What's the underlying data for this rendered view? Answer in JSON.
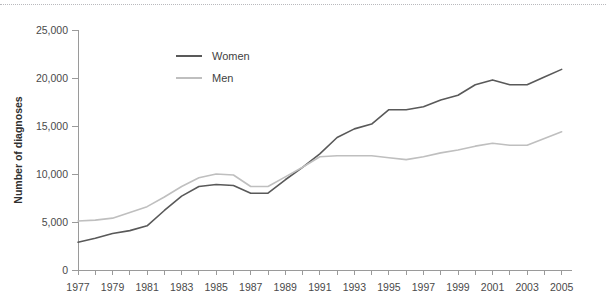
{
  "chart_data": {
    "type": "line",
    "title": "",
    "xlabel": "",
    "ylabel": "Number of diagnoses",
    "xlim": [
      1977,
      2005.6
    ],
    "ylim": [
      0,
      25000
    ],
    "grid": false,
    "legend_position": "inside-upper-left",
    "x": [
      1977,
      1978,
      1979,
      1980,
      1981,
      1982,
      1983,
      1984,
      1985,
      1986,
      1987,
      1988,
      1989,
      1990,
      1991,
      1992,
      1993,
      1994,
      1995,
      1996,
      1997,
      1998,
      1999,
      2000,
      2001,
      2002,
      2003,
      2004,
      2005
    ],
    "series": [
      {
        "name": "Women",
        "color": "#595959",
        "values": [
          2900,
          3300,
          3800,
          4100,
          4600,
          6200,
          7700,
          8700,
          8900,
          8800,
          8000,
          8000,
          9400,
          10700,
          12100,
          13800,
          14700,
          15200,
          16700,
          16700,
          17000,
          17700,
          18200,
          19300,
          19800,
          19300,
          19300,
          20100,
          20900
        ]
      },
      {
        "name": "Men",
        "color": "#bfbfbf",
        "values": [
          5100,
          5200,
          5400,
          6000,
          6600,
          7600,
          8700,
          9600,
          10000,
          9900,
          8700,
          8700,
          9700,
          10700,
          11800,
          11900,
          11900,
          11900,
          11700,
          11500,
          11800,
          12200,
          12500,
          12900,
          13200,
          13000,
          13000,
          13700,
          14400
        ]
      }
    ],
    "ytick_labels": [
      "0",
      "5,000",
      "10,000",
      "15,000",
      "20,000",
      "25,000"
    ],
    "ytick_values": [
      0,
      5000,
      10000,
      15000,
      20000,
      25000
    ],
    "xtick_labels": [
      "1977",
      "1979",
      "1981",
      "1983",
      "1985",
      "1987",
      "1989",
      "1991",
      "1993",
      "1995",
      "1997",
      "1999",
      "2001",
      "2003",
      "2005"
    ],
    "xtick_values": [
      1977,
      1979,
      1981,
      1983,
      1985,
      1987,
      1989,
      1991,
      1993,
      1995,
      1997,
      1999,
      2001,
      2003,
      2005
    ],
    "xminor_values": [
      1977,
      1978,
      1979,
      1980,
      1981,
      1982,
      1983,
      1984,
      1985,
      1986,
      1987,
      1988,
      1989,
      1990,
      1991,
      1992,
      1993,
      1994,
      1995,
      1996,
      1997,
      1998,
      1999,
      2000,
      2001,
      2002,
      2003,
      2004,
      2005
    ],
    "legend": [
      {
        "label": "Women",
        "color": "#595959"
      },
      {
        "label": "Men",
        "color": "#bfbfbf"
      }
    ]
  },
  "style": {
    "background": "#ffffff",
    "axis_color": "#9a9a9a",
    "tick_text_color": "#4a4a4a",
    "axis_title_color": "#2f2f2f",
    "top_rule_color": "#b9b9bd"
  }
}
